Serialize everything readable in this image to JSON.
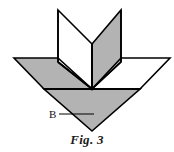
{
  "figure": {
    "caption": "Fig. 3",
    "labels": [
      {
        "id": "B",
        "text": "B",
        "x": 49,
        "y": 109,
        "leader_line": {
          "x1": 59,
          "y1": 114,
          "x2": 94,
          "y2": 114
        }
      }
    ],
    "colors": {
      "stroke": "#000000",
      "shaded_fill": "#b3b3b3",
      "unshaded_fill": "#ffffff",
      "background": "#ffffff",
      "label_text": "#111111",
      "caption_text": "#1a1a1a"
    },
    "geometry": {
      "stroke_width": 1.6,
      "points": {
        "top_left_outer": [
          58,
          10
        ],
        "top_right_outer": [
          121,
          10
        ],
        "left_panel_bottom_left": [
          58,
          62
        ],
        "right_panel_bottom_right": [
          121,
          62
        ],
        "center_fold_top": [
          92,
          44
        ],
        "center_apex": [
          92,
          89
        ],
        "left_wing_tip": [
          14,
          58
        ],
        "right_wing_tip": [
          170,
          58
        ],
        "left_wing_inner": [
          44,
          89
        ],
        "right_wing_inner": [
          140,
          89
        ],
        "bottom_apex": [
          92,
          131
        ]
      },
      "shapes": [
        {
          "name": "left-upright-panel",
          "fill": "unshaded",
          "points": "58,10 92,44 92,89 58,62"
        },
        {
          "name": "right-upright-panel",
          "fill": "shaded",
          "points": "121,10 121,62 92,89 92,44"
        },
        {
          "name": "left-wing",
          "fill": "shaded",
          "points": "14,58 58,58 92,89 44,89"
        },
        {
          "name": "right-wing",
          "fill": "unshaded",
          "points": "121,58 170,58 140,89 92,89"
        },
        {
          "name": "bottom-triangle",
          "fill": "shaded",
          "points": "44,89 140,89 92,131"
        }
      ],
      "fold_lines": [
        {
          "name": "center-vertical-fold",
          "x1": 92,
          "y1": 44,
          "x2": 92,
          "y2": 89
        },
        {
          "name": "left-panel-fold",
          "x1": 58,
          "y1": 10,
          "x2": 58,
          "y2": 62
        },
        {
          "name": "right-panel-fold",
          "x1": 121,
          "y1": 10,
          "x2": 121,
          "y2": 62
        },
        {
          "name": "left-panel-diagonal",
          "x1": 58,
          "y1": 10,
          "x2": 92,
          "y2": 44
        },
        {
          "name": "right-panel-diagonal",
          "x1": 121,
          "y1": 10,
          "x2": 92,
          "y2": 44
        },
        {
          "name": "left-wing-diagonal",
          "x1": 58,
          "y1": 62,
          "x2": 92,
          "y2": 89
        },
        {
          "name": "right-wing-diagonal",
          "x1": 121,
          "y1": 62,
          "x2": 92,
          "y2": 89
        },
        {
          "name": "horizontal-base-line",
          "x1": 44,
          "y1": 89,
          "x2": 140,
          "y2": 89
        }
      ]
    }
  }
}
